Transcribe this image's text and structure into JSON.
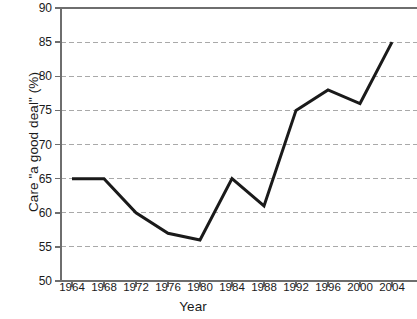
{
  "chart_data": {
    "type": "line",
    "title": "",
    "xlabel": "Year",
    "ylabel": "Care \"a good deal\" (%)",
    "categories": [
      1964,
      1968,
      1972,
      1976,
      1980,
      1984,
      1988,
      1992,
      1996,
      2000,
      2004
    ],
    "x_tick_labels": [
      "1964",
      "1968",
      "1972",
      "1976",
      "1980",
      "1984",
      "1988",
      "1992",
      "1996",
      "2000",
      "2004"
    ],
    "values": [
      65,
      65,
      60,
      57,
      56,
      65,
      61,
      75,
      78,
      76,
      85
    ],
    "series": [
      {
        "name": "Care \"a good deal\"",
        "values": [
          65,
          65,
          60,
          57,
          56,
          65,
          61,
          75,
          78,
          76,
          85
        ]
      }
    ],
    "xlim": [
      1964,
      2004
    ],
    "ylim": [
      50,
      90
    ],
    "y_ticks": [
      50,
      55,
      60,
      65,
      70,
      75,
      80,
      85,
      90
    ],
    "y_tick_labels": [
      "50",
      "55",
      "60",
      "65",
      "70",
      "75",
      "80",
      "85",
      "90"
    ],
    "grid": "horizontal-dashed",
    "legend": "none",
    "markers": "none",
    "colors": {
      "line": "#1a1a1a",
      "gridline": "#a9a9a9",
      "axis": "#6e6e6e",
      "background": "#ffffff",
      "text": "#1a1a1a"
    },
    "line_width": 3
  },
  "axis": {
    "y_title": "Care \"a good deal\" (%)",
    "x_title": "Year"
  }
}
